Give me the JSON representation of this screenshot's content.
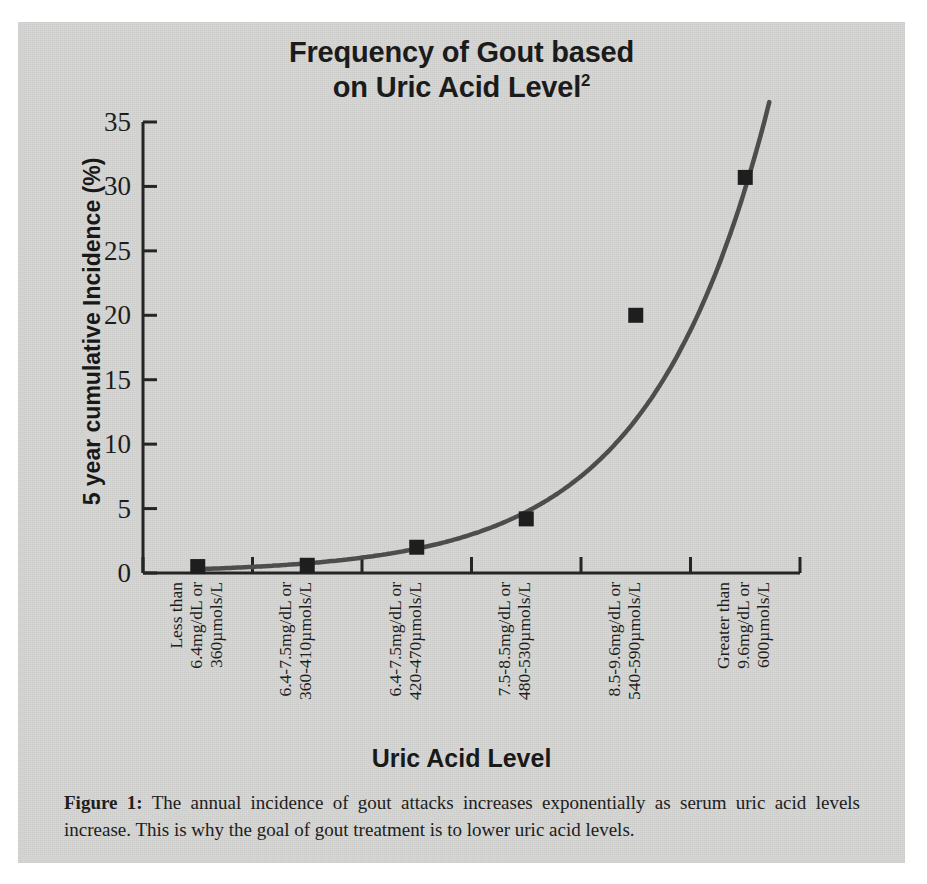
{
  "figure": {
    "panel_bg": "#d6d6d4",
    "title_line1": "Frequency of Gout based",
    "title_line2": "on Uric Acid Level",
    "title_superscript": "2",
    "caption_label": "Figure 1:",
    "caption_text": "The annual incidence of gout attacks increases exponentially as serum uric acid levels increase.  This is why the goal of gout treatment is to lower uric acid levels."
  },
  "chart_data": {
    "type": "scatter",
    "xlabel": "Uric Acid Level",
    "ylabel": "5 year cumulative Incidence (%)",
    "ylim": [
      0,
      35
    ],
    "yticks": [
      0,
      5,
      10,
      15,
      20,
      25,
      30,
      35
    ],
    "ytick_labels": [
      "0",
      "5",
      "10",
      "15",
      "20",
      "25",
      "30",
      "35"
    ],
    "grid": false,
    "legend": false,
    "marker": "square",
    "marker_color": "#1e1e1e",
    "line_color": "#4a4a4a",
    "trend_line": "exponential fit through points, continuing past last point to top of axis",
    "categories": [
      "Less than 6.4mg/dL or 360µmols/L",
      "6.4-7.5mg/dL or 360-410µmols/L",
      "6.4-7.5mg/dL or 420-470µmols/L",
      "7.5-8.5mg/dL or 480-530µmols/L",
      "8.5-9.6mg/dL or 540-590µmols/L",
      "Greater than 9.6mg/dL or 600µmols/L"
    ],
    "category_lines": [
      [
        "Less than",
        "6.4mg/dL or",
        "360µmols/L"
      ],
      [
        "6.4-7.5mg/dL or",
        "360-410µmols/L"
      ],
      [
        "6.4-7.5mg/dL or",
        "420-470µmols/L"
      ],
      [
        "7.5-8.5mg/dL or",
        "480-530µmols/L"
      ],
      [
        "8.5-9.6mg/dL or",
        "540-590µmols/L"
      ],
      [
        "Greater than",
        "9.6mg/dL or",
        "600µmols/L"
      ]
    ],
    "values": [
      0.5,
      0.6,
      2.0,
      4.2,
      20.0,
      30.7
    ]
  }
}
